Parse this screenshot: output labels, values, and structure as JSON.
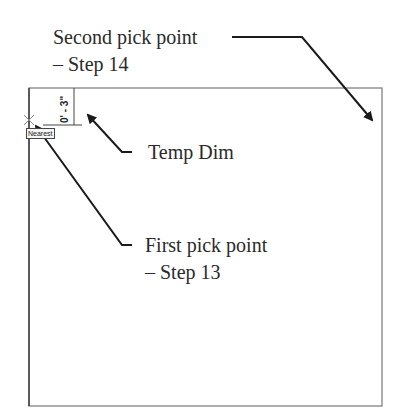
{
  "callouts": {
    "second_pick": {
      "line1": "Second pick point",
      "line2": "– Step 14"
    },
    "temp_dim": {
      "text": "Temp Dim"
    },
    "first_pick": {
      "line1": "First pick point",
      "line2": "– Step 13"
    }
  },
  "drawing": {
    "temp_dimension_value": "0' - 3\"",
    "snap_tooltip": "Nearest"
  },
  "colors": {
    "line": "#222222",
    "frame": "#666666"
  }
}
